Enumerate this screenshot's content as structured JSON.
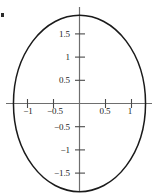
{
  "figure": {
    "background_color": "#ffffff",
    "curve_color": "#1a1a1a",
    "axis_color": "#6e6e6e",
    "label_color": "#1c1c1c"
  },
  "chart_data": {
    "type": "line",
    "title": "",
    "xlabel": "",
    "ylabel": "",
    "shape": "ellipse",
    "center": [
      0,
      0
    ],
    "semi_axis_x": 1.27,
    "semi_axis_y": 1.9,
    "equation": "x^2/1.6 + y^2/3.6 = 1",
    "xlim": [
      -1.45,
      1.45
    ],
    "ylim": [
      -2.05,
      2.05
    ],
    "grid": false,
    "legend": "none",
    "x_ticks": [
      -1,
      -0.5,
      0.5,
      1
    ],
    "x_tick_labels": [
      "−1",
      "−0.5",
      "0.5",
      "1"
    ],
    "y_ticks": [
      1.5,
      1,
      0.5,
      -0.5,
      -1,
      -1.5
    ],
    "y_tick_labels": [
      "1.5",
      "1",
      "0.5",
      "−0.5",
      "−1",
      "−1.5"
    ],
    "x_points": [
      1.27,
      1.2594,
      1.2277,
      1.1755,
      1.1037,
      1.0135,
      0.9066,
      0.7849,
      0.6506,
      0.5062,
      0.3545,
      0.1983,
      0.0399,
      -0.1186,
      -0.2751,
      -0.4275,
      -0.5738,
      -0.712,
      -0.8404,
      -0.9574,
      -1.0614,
      -1.1511,
      -1.2254,
      -1.2834,
      -1.3243,
      -1.3476,
      -1.3532,
      -1.3409,
      -1.311,
      -1.2639,
      -1.2003,
      -1.1212,
      -1.0278,
      -0.9214,
      -0.8038,
      -0.6767,
      -0.542,
      -0.4018,
      -0.2583,
      -0.1137,
      0.0299,
      0.1705,
      0.3059,
      0.4342,
      0.5535,
      0.662,
      0.758,
      0.8402,
      0.9072,
      0.958,
      0.9918,
      1.008,
      1.0064,
      0.987,
      0.95,
      0.8961,
      0.8262,
      0.7414,
      0.6432,
      0.5332,
      0.4132,
      0.2854,
      0.152,
      0.0154,
      -0.1219,
      -0.2575,
      -0.3888,
      -0.5135,
      -0.6293,
      -0.7341,
      -0.826,
      -0.9032,
      -0.9643,
      -1.008,
      -1.0336,
      -1.0403,
      -1.0281,
      -0.9969,
      -0.9474,
      -0.8803,
      -0.7968,
      -0.6983,
      -0.5867,
      -0.4641,
      -0.3327,
      -0.1951,
      -0.0539,
      0.088,
      0.2282,
      0.364,
      0.4929,
      0.6126,
      0.7209,
      0.8158,
      0.8955,
      0.9586,
      1.0038,
      1.0304,
      1.0378,
      1.0259,
      0.9949,
      0.9455,
      1.27
    ],
    "y_points": [
      0.0,
      0.1909,
      0.3804,
      0.5669,
      0.7489,
      0.9249,
      1.0934,
      1.2532,
      1.4028,
      1.5411,
      1.667,
      1.7794,
      1.8775,
      1.9604,
      2.0276,
      2.0784,
      2.1126,
      2.1299,
      2.1302,
      2.1136,
      2.0803,
      2.0307,
      1.9653,
      1.8848,
      1.7899,
      1.6817,
      1.5612,
      1.4297,
      1.2885,
      1.1389,
      0.9826,
      0.8211,
      0.656,
      0.4891,
      0.3222,
      0.1568,
      -0.0052,
      -0.1621,
      -0.3123,
      -0.4542,
      -0.5862,
      -0.707,
      -0.8152,
      -0.9097,
      -0.9895,
      -1.0535,
      -1.1012,
      -1.1318,
      -1.1451,
      -1.1407,
      -1.1187,
      -1.0792,
      -1.0226,
      -0.9495,
      -0.8607,
      -0.7571,
      -0.6399,
      -0.5104,
      -0.3701,
      -0.2207,
      -0.0639,
      0.0982,
      0.2637,
      0.4304,
      0.5962,
      0.7589,
      0.9165,
      1.0668,
      1.2079,
      1.3378,
      1.4548,
      1.5571,
      1.6433,
      1.7121,
      1.7622,
      1.7929,
      1.8035,
      1.7936,
      1.7632,
      1.7124,
      1.6416,
      1.5516,
      1.4432,
      1.3177,
      1.1766,
      1.0214,
      0.8539,
      0.6763,
      0.4906,
      0.2992,
      0.1044,
      -0.0914,
      -0.2857,
      -0.4762,
      -0.6605,
      -0.8363,
      -1.0014,
      -1.1537,
      -1.2913,
      -1.4124,
      -1.5155,
      -1.5991,
      0.0
    ]
  },
  "annotations": {
    "edge_mark": "edge-artifact"
  }
}
